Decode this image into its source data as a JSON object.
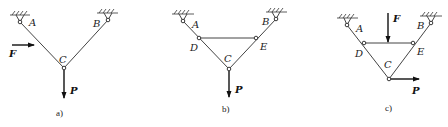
{
  "figure": {
    "panels": [
      {
        "id": "a",
        "caption": "a)",
        "nodes": {
          "A": "A",
          "B": "B",
          "C": "C"
        },
        "forces": {
          "F": "F",
          "P": "P"
        },
        "members": [
          "AC",
          "BC"
        ],
        "supports": [
          "A",
          "B"
        ]
      },
      {
        "id": "b",
        "caption": "b)",
        "nodes": {
          "A": "A",
          "B": "B",
          "C": "C",
          "D": "D",
          "E": "E"
        },
        "forces": {
          "P": "P"
        },
        "members": [
          "AD",
          "DC",
          "BE",
          "EC",
          "DE"
        ],
        "supports": [
          "A",
          "B"
        ]
      },
      {
        "id": "c",
        "caption": "c)",
        "nodes": {
          "A": "A",
          "B": "B",
          "C": "C",
          "D": "D",
          "E": "E"
        },
        "forces": {
          "F": "F",
          "P": "P"
        },
        "members": [
          "AD",
          "DC",
          "BE",
          "EC",
          "DE"
        ],
        "supports": [
          "A",
          "B"
        ]
      }
    ]
  },
  "colors": {
    "line": "#444444",
    "text": "#222222",
    "background": "#ffffff"
  }
}
